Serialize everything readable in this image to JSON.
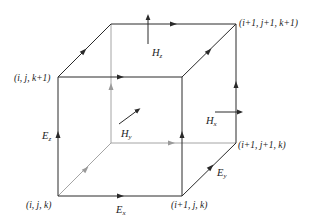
{
  "diagram": {
    "type": "yee-cell",
    "colors": {
      "edge": "#2a2a2a",
      "hidden_edge": "#9a9a9a",
      "background": "#ffffff"
    },
    "nodes": {
      "ijk": "(i, j, k)",
      "i1jk": "(i+1, j, k)",
      "i1j1k": "(i+1, j+1, k)",
      "ijk1": "(i, j, k+1)",
      "i1j1k1": "(i+1, j+1, k+1)"
    },
    "fields": {
      "Ex": {
        "base": "E",
        "sub": "x"
      },
      "Ey": {
        "base": "E",
        "sub": "y"
      },
      "Ez": {
        "base": "E",
        "sub": "z"
      },
      "Hx": {
        "base": "H",
        "sub": "x"
      },
      "Hy": {
        "base": "H",
        "sub": "y"
      },
      "Hz": {
        "base": "H",
        "sub": "z"
      }
    }
  }
}
